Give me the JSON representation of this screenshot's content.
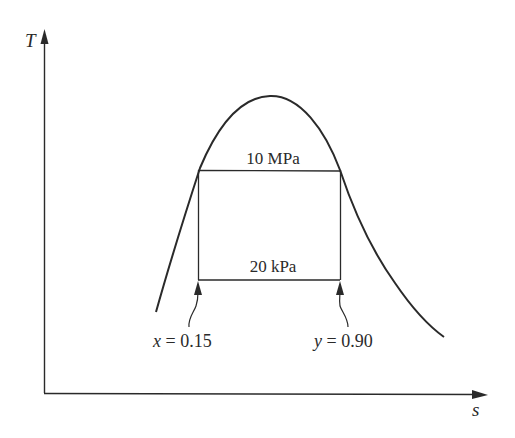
{
  "diagram": {
    "type": "T-s diagram",
    "axes": {
      "y_label": "T",
      "x_label": "s"
    },
    "isobars": [
      {
        "label": "10 MPa"
      },
      {
        "label": "20 kPa"
      }
    ],
    "state_annotations": [
      {
        "label": "x = 0.15",
        "var": "x",
        "eq": "= 0.15"
      },
      {
        "label": "y = 0.90",
        "var": "y",
        "eq": "= 0.90"
      }
    ],
    "colors": {
      "line": "#2a2a2a",
      "background": "#ffffff"
    }
  }
}
